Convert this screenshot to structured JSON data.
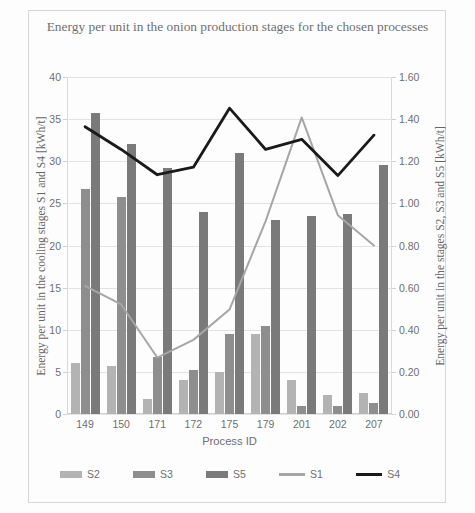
{
  "chart_data": {
    "type": "bar",
    "title": "Energy per unit in the onion production stages for the chosen processes",
    "xlabel": "Process ID",
    "ylabel": "Energy per unit in the cooling stages S1 and S4 [kWh/t]",
    "ylabel_secondary": "Energy per unit in the stages S2, S3 and S5 [kWh/t]",
    "categories": [
      "149",
      "150",
      "171",
      "172",
      "175",
      "179",
      "201",
      "202",
      "207"
    ],
    "ylim": [
      0,
      40
    ],
    "yticks": [
      "0",
      "5",
      "10",
      "15",
      "20",
      "25",
      "30",
      "35",
      "40"
    ],
    "ylim_secondary": [
      0,
      1.6
    ],
    "yticks_secondary": [
      "0.00",
      "0.20",
      "0.40",
      "0.60",
      "0.80",
      "1.00",
      "1.20",
      "1.40",
      "1.60"
    ],
    "grid": true,
    "legend_position": "bottom",
    "series": [
      {
        "name": "S2",
        "kind": "bar",
        "axis": "secondary",
        "color": "#b3b3b3",
        "values": [
          0.24,
          0.23,
          0.07,
          0.16,
          0.2,
          0.38,
          0.16,
          0.09,
          0.1
        ]
      },
      {
        "name": "S3",
        "kind": "bar",
        "axis": "secondary",
        "color": "#8e8e8e",
        "values": [
          1.07,
          1.03,
          0.27,
          0.21,
          0.38,
          0.42,
          0.04,
          0.04,
          0.05
        ]
      },
      {
        "name": "S5",
        "kind": "bar",
        "axis": "secondary",
        "color": "#7a7a7a",
        "values": [
          1.43,
          1.28,
          1.17,
          0.96,
          1.24,
          0.92,
          0.94,
          0.95,
          1.18
        ]
      },
      {
        "name": "S1",
        "kind": "line",
        "axis": "primary",
        "color": "#a6a6a6",
        "values": [
          15.2,
          13.0,
          6.7,
          8.8,
          12.4,
          22.9,
          35.2,
          23.6,
          20.0
        ]
      },
      {
        "name": "S4",
        "kind": "line",
        "axis": "primary",
        "color": "#1a1a1a",
        "values": [
          34.1,
          31.4,
          28.4,
          29.3,
          36.3,
          31.4,
          32.6,
          28.3,
          33.1
        ]
      }
    ]
  },
  "legend": {
    "items": [
      {
        "label": "S2",
        "type": "swatch",
        "color": "#b3b3b3"
      },
      {
        "label": "S3",
        "type": "swatch",
        "color": "#8e8e8e"
      },
      {
        "label": "S5",
        "type": "swatch",
        "color": "#7a7a7a"
      },
      {
        "label": "S1",
        "type": "line",
        "color": "#a6a6a6"
      },
      {
        "label": "S4",
        "type": "line",
        "color": "#1a1a1a"
      }
    ]
  }
}
